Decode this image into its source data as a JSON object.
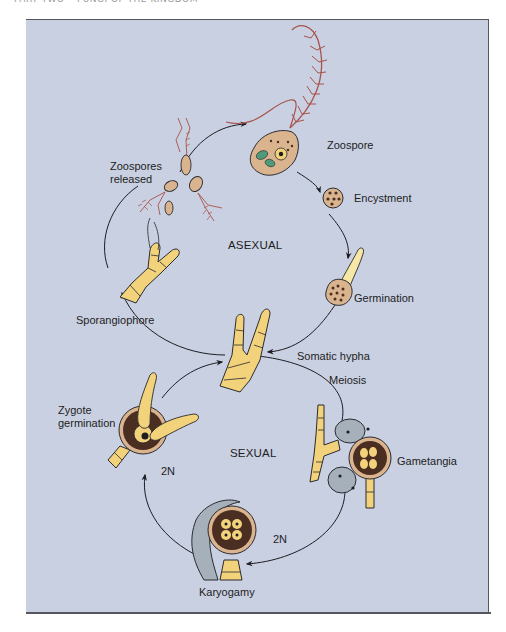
{
  "header": {
    "running_head": "PART TWO • FUNGI OF THE KINGDOM"
  },
  "diagram": {
    "cycles": {
      "asexual": "ASEXUAL",
      "sexual": "SEXUAL"
    },
    "stages": {
      "zoospore": "Zoospore",
      "encystment": "Encystment",
      "germination": "Germination",
      "somatic_hypha": "Somatic hypha",
      "meiosis": "Meiosis",
      "gametangia": "Gametangia",
      "ploidy_bottom": "2N",
      "karyogamy": "Karyogamy",
      "ploidy_left": "2N",
      "zygote_germination_line1": "Zygote",
      "zygote_germination_line2": "germination",
      "sporangiophore": "Sporangiophore",
      "zoospores_released_line1": "Zoospores",
      "zoospores_released_line2": "released"
    },
    "colors": {
      "background": "#c9d0e2",
      "hypha": "#f2d27a",
      "spore_body": "#d9b48f",
      "flagellum": "#a8524a",
      "chloroplast": "#4f9a7a",
      "zygote_wall": "#4a2e22",
      "gametangium": "#a6b0ba",
      "outline": "#2a2a30"
    }
  }
}
